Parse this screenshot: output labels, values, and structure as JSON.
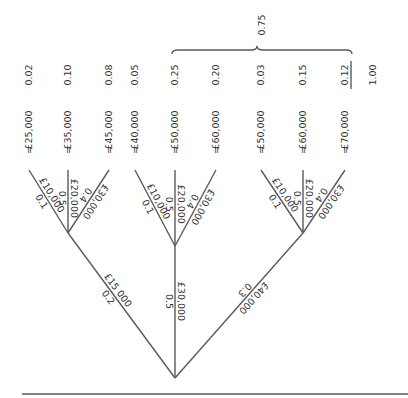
{
  "diagram": {
    "type": "probability-tree",
    "root": {
      "x": 175,
      "y": 378
    },
    "baseline": {
      "x1": 22,
      "x2": 408,
      "y": 394
    },
    "stroke_color": "#5a5a5a",
    "text_color": "#333333",
    "first_level": [
      {
        "amount": "£15 000",
        "prob": "0.2",
        "node": {
          "x": 68,
          "y": 233
        }
      },
      {
        "amount": "£30,000",
        "prob": "0.5",
        "node": {
          "x": 175,
          "y": 246
        }
      },
      {
        "amount": "£40,000",
        "prob": "0.3",
        "node": {
          "x": 303,
          "y": 233
        }
      }
    ],
    "second_level": [
      {
        "parent": 0,
        "amount": "£10,000",
        "prob": "0.1",
        "leaf_x": 29,
        "result": "£25,000",
        "joint": "0.02"
      },
      {
        "parent": 0,
        "amount": "£20,000",
        "prob": "0.5",
        "leaf_x": 68,
        "result": "£35,000",
        "joint": "0.10"
      },
      {
        "parent": 0,
        "amount": "£30,000",
        "prob": "0.4",
        "leaf_x": 109,
        "result": "£45,000",
        "joint": "0.08"
      },
      {
        "parent": 1,
        "amount": "£10,000",
        "prob": "0.1",
        "leaf_x": 135,
        "result": "£40,000",
        "joint": "0.05"
      },
      {
        "parent": 1,
        "amount": "£20,000",
        "prob": "0.5",
        "leaf_x": 175,
        "result": "£50,000",
        "joint": "0.25"
      },
      {
        "parent": 1,
        "amount": "£30,000",
        "prob": "0.4",
        "leaf_x": 216,
        "result": "£60,000",
        "joint": "0.20"
      },
      {
        "parent": 2,
        "amount": "£10,000",
        "prob": "0.1",
        "leaf_x": 261,
        "result": "£50,000",
        "joint": "0.03"
      },
      {
        "parent": 2,
        "amount": "£20,000",
        "prob": "0.5",
        "leaf_x": 303,
        "result": "£60,000",
        "joint": "0.15"
      },
      {
        "parent": 2,
        "amount": "£30,000",
        "prob": "0.4",
        "leaf_x": 345,
        "result": "£70,000",
        "joint": "0.12"
      }
    ],
    "leaf_y": 170,
    "equals_sign": "=",
    "brace": {
      "x1": 172,
      "x2": 352,
      "y": 50,
      "label": "0.75",
      "label_x": 265,
      "label_y": 25
    },
    "total": {
      "value": "1.00",
      "x": 373
    },
    "underlined_joint_index": 8
  }
}
